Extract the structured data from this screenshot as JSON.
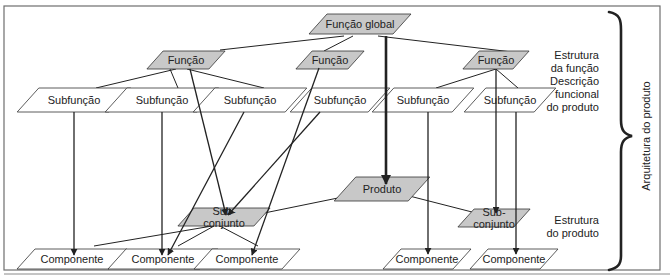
{
  "colors": {
    "frame": "#6e6e6e",
    "gray_fill": "#c8c8c8",
    "white_fill": "#ffffff",
    "stroke": "#333333",
    "line": "#222222",
    "text": "#222222"
  },
  "nodes": [
    {
      "id": "global",
      "label": "Função global",
      "cx": 360,
      "cy": 24,
      "w": 84,
      "h": 20,
      "fill": "gray"
    },
    {
      "id": "f1",
      "label": "Função",
      "cx": 186,
      "cy": 60,
      "w": 62,
      "h": 18,
      "fill": "gray"
    },
    {
      "id": "f2",
      "label": "Função",
      "cx": 330,
      "cy": 60,
      "w": 52,
      "h": 18,
      "fill": "gray"
    },
    {
      "id": "f3",
      "label": "Função",
      "cx": 496,
      "cy": 60,
      "w": 50,
      "h": 18,
      "fill": "gray"
    },
    {
      "id": "s1",
      "label": "Subfunção",
      "cx": 74,
      "cy": 100,
      "w": 92,
      "h": 24,
      "fill": "white"
    },
    {
      "id": "s2",
      "label": "Subfunção",
      "cx": 162,
      "cy": 100,
      "w": 92,
      "h": 24,
      "fill": "white"
    },
    {
      "id": "s3",
      "label": "Subfunção",
      "cx": 250,
      "cy": 100,
      "w": 92,
      "h": 24,
      "fill": "white"
    },
    {
      "id": "s4",
      "label": "Subfunção",
      "cx": 340,
      "cy": 100,
      "w": 78,
      "h": 24,
      "fill": "white"
    },
    {
      "id": "s5",
      "label": "Subfunção",
      "cx": 423,
      "cy": 100,
      "w": 80,
      "h": 24,
      "fill": "white"
    },
    {
      "id": "s6",
      "label": "Subfunção",
      "cx": 510,
      "cy": 100,
      "w": 70,
      "h": 24,
      "fill": "white"
    },
    {
      "id": "produto",
      "label": "Produto",
      "cx": 382,
      "cy": 189,
      "w": 74,
      "h": 24,
      "fill": "gray"
    },
    {
      "id": "sc1",
      "label": "Sub-\nconjunto",
      "cx": 224,
      "cy": 217,
      "w": 76,
      "h": 18,
      "fill": "gray"
    },
    {
      "id": "sc2",
      "label": "Sub-\nconjunto",
      "cx": 494,
      "cy": 218,
      "w": 56,
      "h": 18,
      "fill": "gray"
    },
    {
      "id": "c1",
      "label": "Componente",
      "cx": 72,
      "cy": 259,
      "w": 92,
      "h": 20,
      "fill": "white"
    },
    {
      "id": "c2",
      "label": "Componente",
      "cx": 163,
      "cy": 259,
      "w": 92,
      "h": 20,
      "fill": "white"
    },
    {
      "id": "c3",
      "label": "Componente",
      "cx": 247,
      "cy": 259,
      "w": 88,
      "h": 20,
      "fill": "white"
    },
    {
      "id": "c4",
      "label": "Componente",
      "cx": 427,
      "cy": 259,
      "w": 70,
      "h": 20,
      "fill": "white"
    },
    {
      "id": "c5",
      "label": "Componente",
      "cx": 514,
      "cy": 259,
      "w": 70,
      "h": 20,
      "fill": "white"
    }
  ],
  "tree_lines": [
    [
      344,
      36,
      220,
      50
    ],
    [
      378,
      36,
      512,
      52
    ],
    [
      353,
      36,
      324,
      51
    ],
    [
      176,
      69,
      96,
      88
    ],
    [
      170,
      69,
      178,
      88
    ],
    [
      187,
      69,
      264,
      88
    ],
    [
      496,
      69,
      436,
      88
    ],
    [
      496,
      69,
      518,
      88
    ],
    [
      382,
      189,
      230,
      220
    ],
    [
      382,
      189,
      472,
      212
    ],
    [
      218,
      225,
      94,
      246
    ],
    [
      214,
      226,
      178,
      246
    ],
    [
      218,
      225,
      258,
      246
    ]
  ],
  "arrows": [
    {
      "x1": 74,
      "y1": 112,
      "x2": 74,
      "y2": 255,
      "w": 1.3
    },
    {
      "x1": 162,
      "y1": 112,
      "x2": 162,
      "y2": 255,
      "w": 1.3
    },
    {
      "x1": 190,
      "y1": 69,
      "x2": 226,
      "y2": 215,
      "w": 1.3
    },
    {
      "x1": 244,
      "y1": 112,
      "x2": 168,
      "y2": 255,
      "w": 1.3
    },
    {
      "x1": 320,
      "y1": 112,
      "x2": 228,
      "y2": 215,
      "w": 1.3
    },
    {
      "x1": 319,
      "y1": 68,
      "x2": 252,
      "y2": 255,
      "w": 1.3
    },
    {
      "x1": 386,
      "y1": 36,
      "x2": 386,
      "y2": 184,
      "w": 2.6
    },
    {
      "x1": 428,
      "y1": 112,
      "x2": 428,
      "y2": 254,
      "w": 1.3
    },
    {
      "x1": 496,
      "y1": 69,
      "x2": 496,
      "y2": 213,
      "w": 1.3
    },
    {
      "x1": 516,
      "y1": 112,
      "x2": 516,
      "y2": 254,
      "w": 1.3
    }
  ],
  "side_labels": {
    "function_structure": [
      "Estrutura",
      "da função",
      "Descrição",
      "funcional",
      "do produto"
    ],
    "product_structure": [
      "Estrutura",
      "do produto"
    ],
    "architecture": "Arquitetura do produto"
  }
}
